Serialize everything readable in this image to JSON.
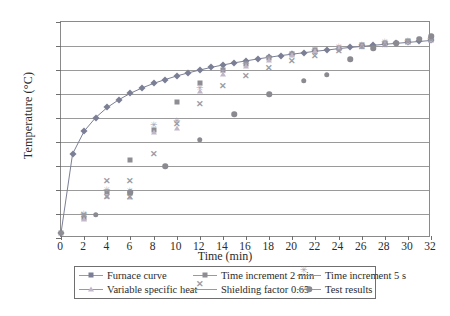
{
  "chart_data": {
    "type": "scatter",
    "title": "",
    "xlabel": "Time (min)",
    "ylabel": "Temperature (°C)",
    "xlim": [
      0,
      32
    ],
    "ylim": [
      0,
      900
    ],
    "xticks": [
      0,
      2,
      4,
      6,
      8,
      10,
      12,
      14,
      16,
      18,
      20,
      22,
      24,
      26,
      28,
      30,
      32
    ],
    "yticks": [
      0,
      100,
      200,
      300,
      400,
      500,
      600,
      700,
      800,
      900
    ],
    "grid": "horizontal",
    "legend_position": "below-axes",
    "series": [
      {
        "name": "Furnace curve",
        "marker": "diamond",
        "line": true,
        "color": "#7b7f95",
        "points": [
          [
            0,
            20
          ],
          [
            1,
            350
          ],
          [
            2,
            445
          ],
          [
            3,
            502
          ],
          [
            4,
            544
          ],
          [
            5,
            576
          ],
          [
            6,
            603
          ],
          [
            7,
            625
          ],
          [
            8,
            644
          ],
          [
            9,
            660
          ],
          [
            10,
            675
          ],
          [
            11,
            688
          ],
          [
            12,
            700
          ],
          [
            13,
            711
          ],
          [
            14,
            721
          ],
          [
            15,
            730
          ],
          [
            16,
            738
          ],
          [
            17,
            746
          ],
          [
            18,
            753
          ],
          [
            19,
            760
          ],
          [
            20,
            766
          ],
          [
            21,
            772
          ],
          [
            22,
            778
          ],
          [
            23,
            783
          ],
          [
            24,
            789
          ],
          [
            25,
            794
          ],
          [
            26,
            798
          ],
          [
            27,
            803
          ],
          [
            28,
            807
          ],
          [
            29,
            811
          ],
          [
            30,
            815
          ],
          [
            31,
            819
          ],
          [
            32,
            823
          ]
        ]
      },
      {
        "name": "Time increment 2 min",
        "marker": "square",
        "line": false,
        "color": "#8d8d93",
        "points": [
          [
            0,
            20
          ],
          [
            2,
            85
          ],
          [
            4,
            190
          ],
          [
            6,
            188
          ],
          [
            6,
            325
          ],
          [
            8,
            452
          ],
          [
            10,
            568
          ],
          [
            12,
            645
          ],
          [
            14,
            700
          ],
          [
            16,
            726
          ],
          [
            18,
            748
          ],
          [
            20,
            766
          ],
          [
            22,
            782
          ],
          [
            24,
            793
          ],
          [
            26,
            804
          ],
          [
            28,
            812
          ],
          [
            30,
            820
          ],
          [
            32,
            828
          ]
        ]
      },
      {
        "name": "Time increment 5 s",
        "marker": "star",
        "line": false,
        "color": "#a9a2b0",
        "points": [
          [
            2,
            96
          ],
          [
            4,
            196
          ],
          [
            6,
            192
          ],
          [
            8,
            468
          ],
          [
            10,
            482
          ],
          [
            12,
            622
          ],
          [
            14,
            690
          ],
          [
            16,
            722
          ],
          [
            18,
            746
          ],
          [
            20,
            764
          ],
          [
            22,
            780
          ],
          [
            24,
            792
          ],
          [
            26,
            802
          ],
          [
            28,
            811
          ],
          [
            30,
            818
          ],
          [
            32,
            826
          ]
        ]
      },
      {
        "name": "Variable specific heat",
        "marker": "triangle",
        "line": false,
        "color": "#c2b7c9",
        "points": [
          [
            2,
            80
          ],
          [
            4,
            175
          ],
          [
            6,
            170
          ],
          [
            8,
            440
          ],
          [
            10,
            458
          ],
          [
            12,
            612
          ],
          [
            14,
            684
          ],
          [
            16,
            718
          ],
          [
            18,
            742
          ],
          [
            20,
            762
          ],
          [
            22,
            778
          ],
          [
            24,
            790
          ],
          [
            26,
            800
          ],
          [
            28,
            809
          ],
          [
            30,
            817
          ],
          [
            32,
            825
          ]
        ]
      },
      {
        "name": "Shielding factor 0.65",
        "marker": "x",
        "line": false,
        "color": "#9b9ba4",
        "points": [
          [
            2,
            92
          ],
          [
            4,
            232
          ],
          [
            6,
            232
          ],
          [
            4,
            168
          ],
          [
            6,
            166
          ],
          [
            8,
            345
          ],
          [
            10,
            470
          ],
          [
            12,
            556
          ],
          [
            14,
            628
          ],
          [
            16,
            672
          ],
          [
            18,
            705
          ],
          [
            20,
            733
          ],
          [
            22,
            756
          ],
          [
            24,
            774
          ],
          [
            26,
            790
          ],
          [
            28,
            802
          ],
          [
            30,
            812
          ],
          [
            32,
            820
          ]
        ]
      },
      {
        "name": "Test results",
        "marker": "circle",
        "line": false,
        "color": "#8a8a90",
        "points": [
          [
            3,
            96
          ],
          [
            6,
            190
          ],
          [
            9,
            300
          ],
          [
            12,
            410
          ],
          [
            15,
            515
          ],
          [
            18,
            598
          ],
          [
            21,
            655
          ],
          [
            23,
            680
          ],
          [
            25,
            745
          ],
          [
            27,
            790
          ],
          [
            29,
            812
          ],
          [
            31,
            830
          ],
          [
            32,
            840
          ]
        ]
      }
    ]
  },
  "axes": {
    "ylabel": "Temperature (°C)",
    "xlabel": "Time (min)"
  },
  "legend": {
    "entries": [
      {
        "label": "Furnace curve",
        "marker": "diamond"
      },
      {
        "label": "Time increment 2 min",
        "marker": "square"
      },
      {
        "label": "Time increment 5 s",
        "marker": "star"
      },
      {
        "label": "Variable specific heat",
        "marker": "triangle"
      },
      {
        "label": "Shielding factor 0.65",
        "marker": "x"
      },
      {
        "label": "Test results",
        "marker": "circle"
      }
    ]
  }
}
